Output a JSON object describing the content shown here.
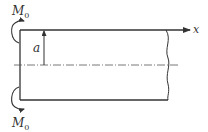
{
  "diagram": {
    "type": "beam-with-end-moments",
    "labels": {
      "moment_top": "M",
      "moment_top_sub": "0",
      "moment_bottom": "M",
      "moment_bottom_sub": "0",
      "axis_x": "x",
      "dimension_a": "a"
    },
    "colors": {
      "line": "#333333",
      "background": "#ffffff"
    }
  }
}
